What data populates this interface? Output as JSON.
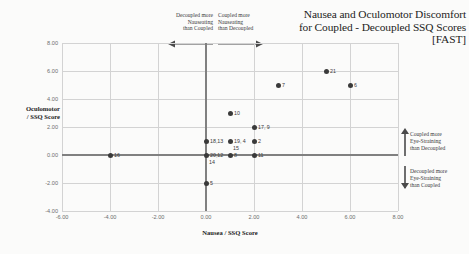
{
  "chart_data": {
    "type": "scatter",
    "title_lines": [
      "Nausea and Oculomotor Discomfort",
      "for Coupled - Decoupled SSQ Scores",
      "[FAST]"
    ],
    "title": "Nausea and Oculomotor Discomfort for Coupled - Decoupled SSQ Scores [FAST]",
    "xlabel": "Nausea / SSQ Score",
    "ylabel_lines": [
      "Oculomotor",
      "/ SSQ Score"
    ],
    "ylabel": "Oculomotor / SSQ Score",
    "xlim": [
      -6,
      8
    ],
    "ylim": [
      -4,
      8
    ],
    "xticks": [
      "-6.00",
      "-4.00",
      "-2.00",
      "0.00",
      "2.00",
      "4.00",
      "6.00",
      "8.00"
    ],
    "xtick_values": [
      -6,
      -4,
      -2,
      0,
      2,
      4,
      6,
      8
    ],
    "yticks": [
      "8.00",
      "6.00",
      "4.00",
      "2.00",
      "0.00",
      "-2.00",
      "-4.00"
    ],
    "ytick_values": [
      8,
      6,
      4,
      2,
      0,
      -2,
      -4
    ],
    "grid": true,
    "legend": "none",
    "marker_color": "#3a3a3a",
    "grid_color": "#d3d3d3",
    "axis_color": "#808080",
    "points": [
      {
        "label": "16",
        "x": -4,
        "y": 0,
        "pos": "right"
      },
      {
        "label": "18,13",
        "x": 0,
        "y": 1,
        "pos": "right"
      },
      {
        "label": "20,12",
        "x": 0,
        "y": 0,
        "pos": "right"
      },
      {
        "label": "14",
        "x": 0,
        "y": 0,
        "pos": "below"
      },
      {
        "label": "5",
        "x": 0,
        "y": -2,
        "pos": "right"
      },
      {
        "label": "19, 4",
        "x": 1,
        "y": 1,
        "pos": "right"
      },
      {
        "label": "15",
        "x": 1,
        "y": 1,
        "pos": "below"
      },
      {
        "label": "8",
        "x": 1,
        "y": 0,
        "pos": "right"
      },
      {
        "label": "10",
        "x": 1,
        "y": 3,
        "pos": "right"
      },
      {
        "label": "2",
        "x": 2,
        "y": 1,
        "pos": "right"
      },
      {
        "label": "11",
        "x": 2,
        "y": 0,
        "pos": "right"
      },
      {
        "label": "17, 9",
        "x": 2,
        "y": 2,
        "pos": "right"
      },
      {
        "label": "7",
        "x": 3,
        "y": 5,
        "pos": "right"
      },
      {
        "label": "21",
        "x": 5,
        "y": 6,
        "pos": "right"
      },
      {
        "label": "6",
        "x": 6,
        "y": 5,
        "pos": "right"
      }
    ]
  },
  "annotations": {
    "decoupled_nausea": [
      "Decoupled more",
      "Nauseating",
      "than Coupled"
    ],
    "coupled_nausea": [
      "Coupled more",
      "Nauseating",
      "than Decoupled"
    ],
    "coupled_eye": [
      "Coupled more",
      "Eye-Straining",
      "than Decoupled"
    ],
    "decoupled_eye": [
      "Decoupled more",
      "Eye-Straining",
      "than Coupled"
    ]
  }
}
